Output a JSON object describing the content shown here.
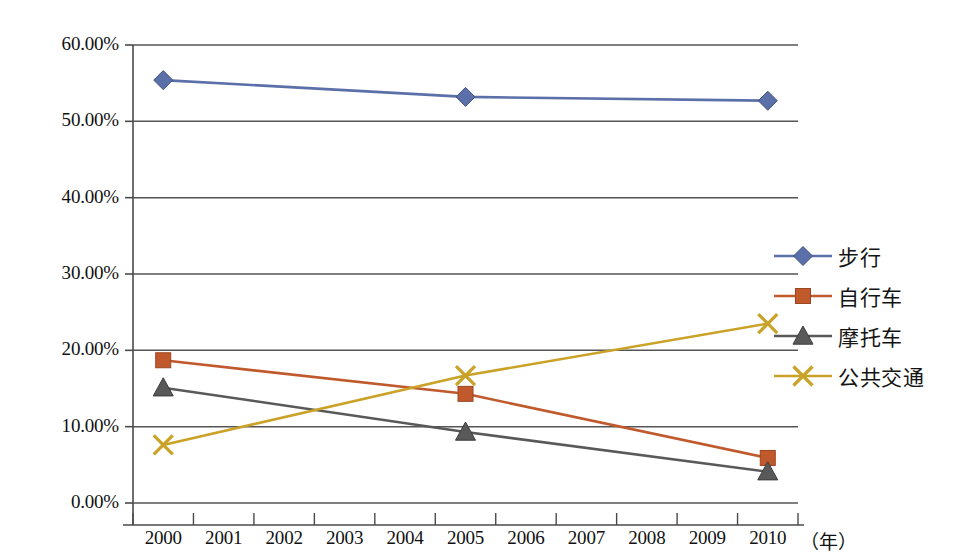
{
  "chart_data": {
    "type": "line",
    "title": "",
    "subtitle": "",
    "xlabel": "(年)",
    "ylabel": "",
    "categories": [
      "2000",
      "2001",
      "2002",
      "2003",
      "2004",
      "2005",
      "2006",
      "2007",
      "2008",
      "2009",
      "2010"
    ],
    "x": [
      2000,
      2005,
      2010
    ],
    "ylim": [
      0,
      60
    ],
    "ytick_labels": [
      "0.00%",
      "10.00%",
      "20.00%",
      "30.00%",
      "40.00%",
      "50.00%",
      "60.00%"
    ],
    "ytick_values": [
      0,
      10,
      20,
      30,
      40,
      50,
      60
    ],
    "grid": true,
    "legend_position": "right",
    "series": [
      {
        "name": "步行",
        "color": "#5B6FA8",
        "marker": "diamond",
        "x": [
          2000,
          2005,
          2010
        ],
        "values": [
          55.4,
          53.2,
          52.7
        ]
      },
      {
        "name": "自行车",
        "color": "#C0592C",
        "marker": "square",
        "x": [
          2000,
          2005,
          2010
        ],
        "values": [
          18.7,
          14.3,
          5.9
        ]
      },
      {
        "name": "摩托车",
        "color": "#595959",
        "marker": "triangle",
        "x": [
          2000,
          2005,
          2010
        ],
        "values": [
          15.1,
          9.3,
          4.1
        ]
      },
      {
        "name": "公共交通",
        "color": "#C9A227",
        "marker": "cross",
        "x": [
          2000,
          2005,
          2010
        ],
        "values": [
          7.6,
          16.7,
          23.5
        ]
      }
    ]
  },
  "axis": {
    "y_ticks": [
      {
        "label": "60.00%",
        "value": 60
      },
      {
        "label": "50.00%",
        "value": 50
      },
      {
        "label": "40.00%",
        "value": 40
      },
      {
        "label": "30.00%",
        "value": 30
      },
      {
        "label": "20.00%",
        "value": 20
      },
      {
        "label": "10.00%",
        "value": 10
      },
      {
        "label": "0.00%",
        "value": 0
      }
    ],
    "x_ticks": [
      "2000",
      "2001",
      "2002",
      "2003",
      "2004",
      "2005",
      "2006",
      "2007",
      "2008",
      "2009",
      "2010"
    ],
    "x_unit": "（年）"
  },
  "legend": {
    "items": [
      {
        "label": "步行",
        "color": "#5B6FA8",
        "marker": "diamond-marker"
      },
      {
        "label": "自行车",
        "color": "#C0592C",
        "marker": "square-marker"
      },
      {
        "label": "摩托车",
        "color": "#595959",
        "marker": "triangle-marker"
      },
      {
        "label": "公共交通",
        "color": "#C9A227",
        "marker": "cross-marker"
      }
    ]
  },
  "colors": {
    "walking": "#5B6FA8",
    "bicycle": "#C0592C",
    "motorcycle": "#595959",
    "transit": "#C9A227",
    "axis": "#4a4a4a",
    "grid": "#555555",
    "background": "#ffffff"
  }
}
